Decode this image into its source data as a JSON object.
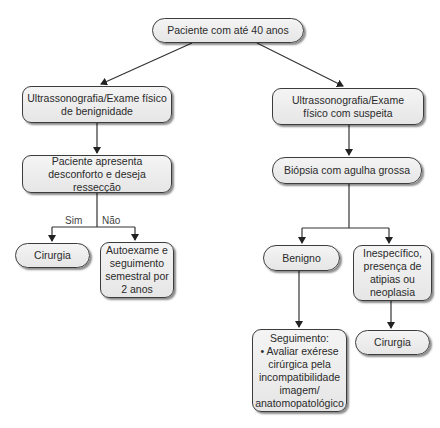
{
  "diagram": {
    "type": "flowchart",
    "nodes": {
      "root": {
        "text": "Paciente com até 40 anos"
      },
      "us_benign": {
        "text": "Ultrassonografia/Exame físico de benignidade"
      },
      "us_suspect": {
        "text": "Ultrassonografia/Exame físico com suspeita"
      },
      "discomfort": {
        "text": "Paciente apresenta desconforto e deseja ressecção"
      },
      "surgery_left": {
        "text": "Cirurgia"
      },
      "self_exam": {
        "text": "Autoexame e seguimento semestral por 2 anos"
      },
      "biopsy": {
        "text": "Biópsia com agulha grossa"
      },
      "benign": {
        "text": "Benigno"
      },
      "nonspecific": {
        "text": "Inespecífico, presença de atipias ou neoplasia"
      },
      "followup": {
        "title": "Seguimento:",
        "bullet": "• Avaliar exérese cirúrgica pela incompatibilidade imagem/ anatomopatológico"
      },
      "surgery_right": {
        "text": "Cirurgia"
      }
    },
    "edge_labels": {
      "yes": "Sim",
      "no": "Não"
    },
    "edges": [
      {
        "from": "root",
        "to": "us_benign"
      },
      {
        "from": "root",
        "to": "us_suspect"
      },
      {
        "from": "us_benign",
        "to": "discomfort"
      },
      {
        "from": "discomfort",
        "to": "surgery_left",
        "label": "Sim"
      },
      {
        "from": "discomfort",
        "to": "self_exam",
        "label": "Não"
      },
      {
        "from": "us_suspect",
        "to": "biopsy"
      },
      {
        "from": "biopsy",
        "to": "benign"
      },
      {
        "from": "biopsy",
        "to": "nonspecific"
      },
      {
        "from": "benign",
        "to": "followup"
      },
      {
        "from": "nonspecific",
        "to": "surgery_right"
      }
    ],
    "colors": {
      "node_fill": "#ececec",
      "node_border": "#3c3c3c",
      "edge": "#333333",
      "text": "#2a2a2a"
    }
  }
}
